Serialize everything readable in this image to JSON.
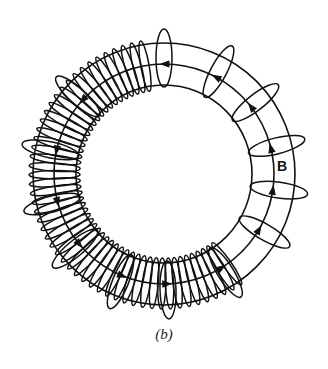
{
  "figure": {
    "caption": "(b)",
    "field_label": "B"
  },
  "geometry": {
    "center": [
      164,
      174
    ],
    "outer_radius": [
      131,
      131
    ],
    "middle_radius": [
      110,
      110
    ],
    "inner_radius": [
      88,
      89
    ],
    "coil_start_deg": -100,
    "coil_end_deg": 55,
    "coil_turns": 52,
    "field_loop_angles_deg": [
      -90,
      -62,
      -38,
      -14,
      8,
      30,
      58,
      88,
      112,
      140,
      165,
      192,
      222
    ]
  },
  "colors": {
    "ink": "#111111",
    "background": "#ffffff"
  }
}
